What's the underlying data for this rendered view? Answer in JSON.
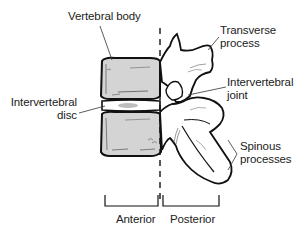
{
  "figure": {
    "view": "lateral view of lumbar vertebrae",
    "labels": {
      "vertebral_body": "Vertebral body",
      "transverse_process": "Transverse\nprocess",
      "intervertebral_joint": "Intervertebral\njoint",
      "intervertebral_disc": "Intervertebral\ndisc",
      "spinous_processes": "Spinous\nprocesses",
      "anterior": "Anterior",
      "posterior": "Posterior"
    },
    "colors": {
      "bone_fill": "#d4d4d4",
      "outline": "#111111",
      "leader_line": "#333333",
      "text": "#222222",
      "disc_nucleus": "#bdbdbd",
      "background": "#ffffff"
    }
  }
}
